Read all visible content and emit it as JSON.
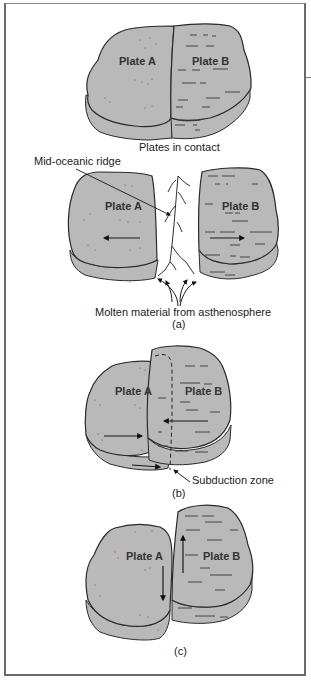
{
  "figure": {
    "panels": [
      {
        "id": "contact",
        "caption": "Plates in contact",
        "plate_a_label": "Plate A",
        "plate_b_label": "Plate B"
      },
      {
        "id": "a",
        "caption": "(a)",
        "plate_a_label": "Plate A",
        "plate_b_label": "Plate B",
        "annotations": {
          "ridge": "Mid-oceanic ridge",
          "molten": "Molten material from asthenosphere"
        },
        "motion": "divergent"
      },
      {
        "id": "b",
        "caption": "(b)",
        "plate_a_label": "Plate A",
        "plate_b_label": "Plate B",
        "annotations": {
          "subduction": "Subduction zone"
        },
        "motion": "convergent"
      },
      {
        "id": "c",
        "caption": "(c)",
        "plate_a_label": "Plate A",
        "plate_b_label": "Plate B",
        "motion": "transform"
      }
    ],
    "colors": {
      "plate_fill": "#b9b9b9",
      "plate_edge": "#2a2a2a",
      "frame": "#6a6a6a",
      "background": "#ffffff"
    }
  }
}
